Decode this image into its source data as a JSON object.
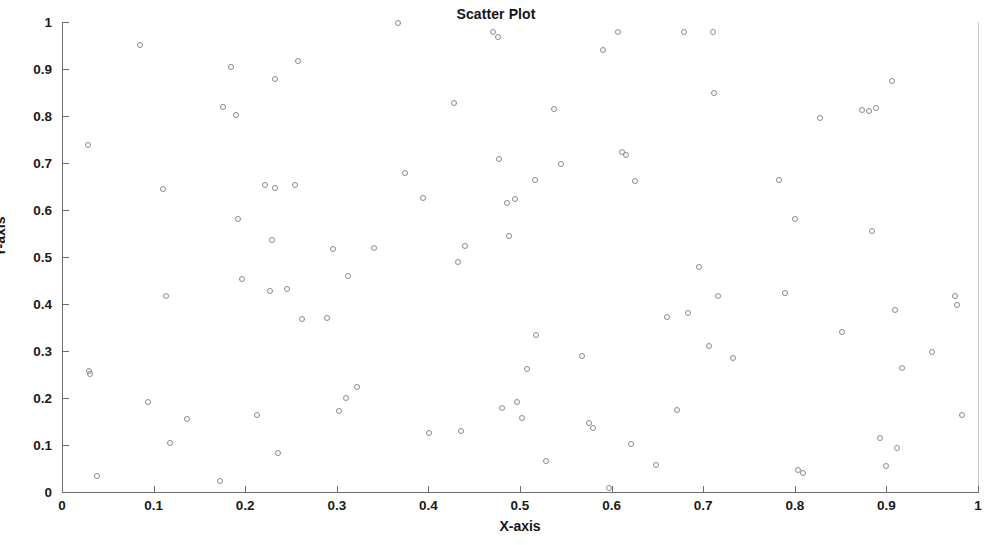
{
  "chart_data": {
    "type": "scatter",
    "title": "Scatter Plot",
    "xlabel": "X-axis",
    "ylabel": "Y-axis",
    "xlim": [
      0,
      1
    ],
    "ylim": [
      0,
      1
    ],
    "grid": false,
    "legend": null,
    "marker": {
      "shape": "circle",
      "filled": false,
      "edge_color": "#8a8a93",
      "size": 6
    },
    "xticks": [
      0,
      0.1,
      0.2,
      0.3,
      0.4,
      0.5,
      0.6,
      0.7,
      0.8,
      0.9,
      1
    ],
    "yticks": [
      0,
      0.1,
      0.2,
      0.3,
      0.4,
      0.5,
      0.6,
      0.7,
      0.8,
      0.9,
      1
    ],
    "xticklabels": [
      "0",
      "0.1",
      "0.2",
      "0.3",
      "0.4",
      "0.5",
      "0.6",
      "0.7",
      "0.8",
      "0.9",
      "1"
    ],
    "yticklabels": [
      "0",
      "0.1",
      "0.2",
      "0.3",
      "0.4",
      "0.5",
      "0.6",
      "0.7",
      "0.8",
      "0.9",
      "1"
    ],
    "n_points": 120,
    "points": [
      [
        0.028,
        0.738
      ],
      [
        0.03,
        0.258
      ],
      [
        0.031,
        0.251
      ],
      [
        0.038,
        0.034
      ],
      [
        0.085,
        0.951
      ],
      [
        0.094,
        0.191
      ],
      [
        0.11,
        0.645
      ],
      [
        0.113,
        0.416
      ],
      [
        0.118,
        0.104
      ],
      [
        0.136,
        0.156
      ],
      [
        0.172,
        0.023
      ],
      [
        0.176,
        0.82
      ],
      [
        0.184,
        0.905
      ],
      [
        0.19,
        0.803
      ],
      [
        0.192,
        0.581
      ],
      [
        0.196,
        0.453
      ],
      [
        0.213,
        0.164
      ],
      [
        0.222,
        0.653
      ],
      [
        0.227,
        0.428
      ],
      [
        0.229,
        0.537
      ],
      [
        0.232,
        0.646
      ],
      [
        0.233,
        0.878
      ],
      [
        0.236,
        0.083
      ],
      [
        0.246,
        0.432
      ],
      [
        0.254,
        0.653
      ],
      [
        0.258,
        0.918
      ],
      [
        0.262,
        0.368
      ],
      [
        0.289,
        0.37
      ],
      [
        0.296,
        0.518
      ],
      [
        0.302,
        0.172
      ],
      [
        0.31,
        0.199
      ],
      [
        0.312,
        0.459
      ],
      [
        0.322,
        0.223
      ],
      [
        0.341,
        0.52
      ],
      [
        0.367,
        0.997
      ],
      [
        0.374,
        0.679
      ],
      [
        0.394,
        0.625
      ],
      [
        0.401,
        0.126
      ],
      [
        0.428,
        0.828
      ],
      [
        0.432,
        0.49
      ],
      [
        0.436,
        0.129
      ],
      [
        0.44,
        0.524
      ],
      [
        0.47,
        0.978
      ],
      [
        0.476,
        0.968
      ],
      [
        0.477,
        0.708
      ],
      [
        0.48,
        0.179
      ],
      [
        0.486,
        0.614
      ],
      [
        0.488,
        0.545
      ],
      [
        0.494,
        0.623
      ],
      [
        0.497,
        0.191
      ],
      [
        0.502,
        0.158
      ],
      [
        0.508,
        0.262
      ],
      [
        0.516,
        0.663
      ],
      [
        0.518,
        0.334
      ],
      [
        0.528,
        0.067
      ],
      [
        0.537,
        0.815
      ],
      [
        0.545,
        0.698
      ],
      [
        0.568,
        0.29
      ],
      [
        0.575,
        0.146
      ],
      [
        0.58,
        0.137
      ],
      [
        0.591,
        0.94
      ],
      [
        0.597,
        0.009
      ],
      [
        0.607,
        0.978
      ],
      [
        0.611,
        0.724
      ],
      [
        0.616,
        0.718
      ],
      [
        0.621,
        0.102
      ],
      [
        0.625,
        0.661
      ],
      [
        0.648,
        0.057
      ],
      [
        0.661,
        0.373
      ],
      [
        0.671,
        0.174
      ],
      [
        0.679,
        0.979
      ],
      [
        0.683,
        0.38
      ],
      [
        0.695,
        0.479
      ],
      [
        0.706,
        0.311
      ],
      [
        0.711,
        0.978
      ],
      [
        0.712,
        0.85
      ],
      [
        0.716,
        0.416
      ],
      [
        0.732,
        0.286
      ],
      [
        0.783,
        0.663
      ],
      [
        0.789,
        0.423
      ],
      [
        0.8,
        0.58
      ],
      [
        0.803,
        0.046
      ],
      [
        0.809,
        0.04
      ],
      [
        0.828,
        0.795
      ],
      [
        0.852,
        0.34
      ],
      [
        0.873,
        0.812
      ],
      [
        0.881,
        0.811
      ],
      [
        0.884,
        0.556
      ],
      [
        0.889,
        0.816
      ],
      [
        0.893,
        0.114
      ],
      [
        0.9,
        0.055
      ],
      [
        0.906,
        0.875
      ],
      [
        0.909,
        0.388
      ],
      [
        0.912,
        0.093
      ],
      [
        0.917,
        0.264
      ],
      [
        0.95,
        0.298
      ],
      [
        0.975,
        0.417
      ],
      [
        0.977,
        0.397
      ],
      [
        0.982,
        0.164
      ]
    ]
  }
}
